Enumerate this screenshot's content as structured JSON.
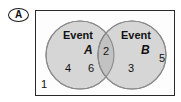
{
  "figure": {
    "part_label": "A",
    "type": "venn-diagram",
    "universe_label": "1"
  },
  "venn": {
    "set_a": {
      "word": "Event",
      "letter": "A",
      "only_values": [
        "4",
        "6"
      ]
    },
    "set_b": {
      "word": "Event",
      "letter": "B",
      "only_values": [
        "3",
        "5"
      ]
    },
    "intersection": {
      "values": [
        "2"
      ]
    },
    "outside": {
      "values": [
        "1"
      ]
    }
  },
  "colors": {
    "circle_fill": "#d6d6d6",
    "intersection_fill": "#c2c2c2",
    "circle_stroke": "#8a8a8a",
    "rect_stroke": "#2a2a2a",
    "text": "#111111",
    "background": "#ffffff"
  }
}
